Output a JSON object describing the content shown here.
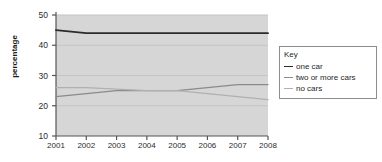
{
  "chart_data": {
    "type": "line",
    "title": "",
    "xlabel": "",
    "ylabel": "percentage",
    "categories": [
      "2001",
      "2002",
      "2003",
      "2004",
      "2005",
      "2006",
      "2007",
      "2008"
    ],
    "ylim": [
      10,
      50
    ],
    "yticks": [
      "10",
      "20",
      "30",
      "40",
      "50"
    ],
    "grid": true,
    "legend_position": "right",
    "legend_title": "Key",
    "series": [
      {
        "name": "one car",
        "color": "#2b2b2b",
        "values": [
          45,
          44,
          44,
          44,
          44,
          44,
          44,
          44
        ]
      },
      {
        "name": "two or more cars",
        "color": "#8a8a8a",
        "values": [
          23,
          24,
          25,
          25,
          25,
          26,
          27,
          27
        ]
      },
      {
        "name": "no cars",
        "color": "#b0b0b0",
        "values": [
          26,
          26,
          25.5,
          25,
          25,
          24,
          23,
          22
        ]
      }
    ]
  },
  "colors": {
    "plot_background": "#d6d6d6",
    "page_background": "#ffffff",
    "axis": "#555555",
    "gridline": "#c4c4c4",
    "legend_border": "#8d8d8d",
    "text": "#2b2b2b"
  }
}
